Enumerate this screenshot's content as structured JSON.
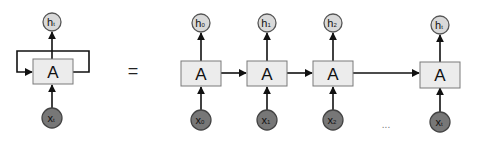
{
  "diagram": {
    "type": "rnn-unrolled",
    "folded": {
      "cell_label": "A",
      "output": {
        "main": "h",
        "sub": "t"
      },
      "input": {
        "main": "x",
        "sub": "t"
      },
      "has_recurrent_loop": true
    },
    "equals_symbol": "=",
    "unrolled": {
      "cells": [
        {
          "cell_label": "A",
          "output": {
            "main": "h",
            "sub": "0"
          },
          "input": {
            "main": "x",
            "sub": "0"
          }
        },
        {
          "cell_label": "A",
          "output": {
            "main": "h",
            "sub": "1"
          },
          "input": {
            "main": "x",
            "sub": "1"
          }
        },
        {
          "cell_label": "A",
          "output": {
            "main": "h",
            "sub": "2"
          },
          "input": {
            "main": "x",
            "sub": "2"
          }
        },
        {
          "cell_label": "A",
          "output": {
            "main": "h",
            "sub": "t"
          },
          "input": {
            "main": "x",
            "sub": "t"
          }
        }
      ],
      "ellipsis": "..."
    },
    "colors": {
      "cell_fill": "#ececec",
      "cell_stroke": "#7a7a7a",
      "output_node_fill": "#d9d9d9",
      "input_node_fill": "#777777",
      "edge": "#111111"
    }
  }
}
